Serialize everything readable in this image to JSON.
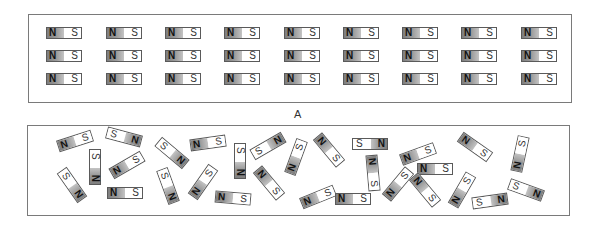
{
  "figure": {
    "label": "A",
    "panel_a": {
      "description": "aligned magnets",
      "rows": 3,
      "cols": 9,
      "magnet_labels": {
        "north": "N",
        "south": "S"
      },
      "col_x": [
        46,
        106,
        165,
        224,
        284,
        343,
        402,
        461,
        521
      ],
      "row_y": [
        27,
        50,
        73
      ]
    },
    "panel_b": {
      "description": "randomly oriented magnets",
      "magnets": [
        {
          "cx": 75,
          "cy": 141,
          "angle": -18,
          "order": "NS"
        },
        {
          "cx": 95,
          "cy": 167,
          "angle": 90,
          "order": "SN"
        },
        {
          "cx": 124,
          "cy": 137,
          "angle": 15,
          "order": "SN"
        },
        {
          "cx": 127,
          "cy": 165,
          "angle": -30,
          "order": "NS"
        },
        {
          "cx": 72,
          "cy": 185,
          "angle": 55,
          "order": "SN"
        },
        {
          "cx": 125,
          "cy": 193,
          "angle": 0,
          "order": "NS"
        },
        {
          "cx": 172,
          "cy": 153,
          "angle": 40,
          "order": "SN"
        },
        {
          "cx": 208,
          "cy": 143,
          "angle": -8,
          "order": "NS"
        },
        {
          "cx": 240,
          "cy": 161,
          "angle": 90,
          "order": "SN"
        },
        {
          "cx": 268,
          "cy": 146,
          "angle": -30,
          "order": "SN"
        },
        {
          "cx": 168,
          "cy": 186,
          "angle": 70,
          "order": "SN"
        },
        {
          "cx": 203,
          "cy": 182,
          "angle": -55,
          "order": "NS"
        },
        {
          "cx": 233,
          "cy": 198,
          "angle": 5,
          "order": "NS"
        },
        {
          "cx": 269,
          "cy": 183,
          "angle": 50,
          "order": "NS"
        },
        {
          "cx": 296,
          "cy": 157,
          "angle": -70,
          "order": "NS"
        },
        {
          "cx": 329,
          "cy": 150,
          "angle": 50,
          "order": "NS"
        },
        {
          "cx": 370,
          "cy": 144,
          "angle": 0,
          "order": "SN"
        },
        {
          "cx": 373,
          "cy": 173,
          "angle": 85,
          "order": "NS"
        },
        {
          "cx": 318,
          "cy": 197,
          "angle": -22,
          "order": "NS"
        },
        {
          "cx": 353,
          "cy": 199,
          "angle": 0,
          "order": "NS"
        },
        {
          "cx": 418,
          "cy": 154,
          "angle": -20,
          "order": "NS"
        },
        {
          "cx": 475,
          "cy": 147,
          "angle": 35,
          "order": "NS"
        },
        {
          "cx": 435,
          "cy": 169,
          "angle": 0,
          "order": "NS"
        },
        {
          "cx": 398,
          "cy": 184,
          "angle": -50,
          "order": "NS"
        },
        {
          "cx": 425,
          "cy": 190,
          "angle": 50,
          "order": "NS"
        },
        {
          "cx": 462,
          "cy": 190,
          "angle": -60,
          "order": "NS"
        },
        {
          "cx": 520,
          "cy": 154,
          "angle": -78,
          "order": "NS"
        },
        {
          "cx": 490,
          "cy": 201,
          "angle": -8,
          "order": "SN"
        },
        {
          "cx": 526,
          "cy": 190,
          "angle": 20,
          "order": "SN"
        }
      ]
    }
  }
}
